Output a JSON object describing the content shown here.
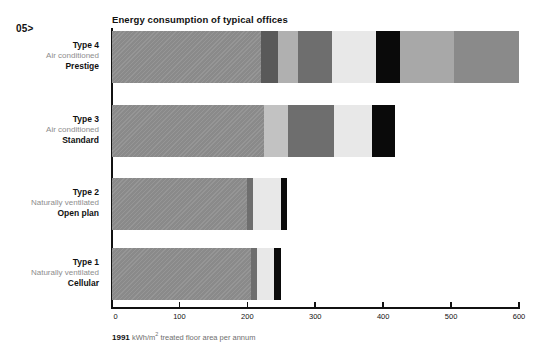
{
  "page_marker": "05>",
  "chart_title": "Energy consumption of typical offices",
  "caption": {
    "year": "1991",
    "unit_prefix": "kWh/m",
    "unit_sup": "2",
    "unit_suffix": " treated floor area per annum"
  },
  "axis": {
    "ticks": [
      0,
      100,
      200,
      300,
      400,
      500,
      600
    ],
    "tick_labels": [
      "0",
      "100",
      "200",
      "300",
      "400",
      "500",
      "600"
    ],
    "min": 0,
    "max": 600
  },
  "rows": [
    {
      "type": "Type 4",
      "middle": "Air conditioned",
      "bold": "Prestige"
    },
    {
      "type": "Type 3",
      "middle": "Air conditioned",
      "bold": "Standard"
    },
    {
      "type": "Type 2",
      "middle": "Naturally ventilated",
      "bold": "Open plan"
    },
    {
      "type": "Type 1",
      "middle": "Naturally ventilated",
      "bold": "Cellular"
    }
  ],
  "colors": {
    "base_gray": "#8a8a8a",
    "dark_gray": "#595959",
    "mid_gray": "#b0b0b0",
    "medium_gray": "#6e6e6e",
    "pale_gray": "#e8e8e8",
    "black": "#0a0a0a",
    "light_gray": "#a8a8a8",
    "edge_gray": "#6b6b6b",
    "axis": "#111111",
    "label_muted": "#8d8d8d"
  },
  "chart_data": {
    "type": "bar",
    "orientation": "horizontal",
    "stacked": true,
    "title": "Energy consumption of typical offices",
    "xlabel": "1991 kWh/m2 treated floor area per annum",
    "ylabel": "",
    "xlim": [
      0,
      600
    ],
    "grid": false,
    "legend": "none",
    "categories": [
      "Type 4 Air conditioned Prestige",
      "Type 3 Air conditioned Standard",
      "Type 2 Naturally ventilated Open plan",
      "Type 1 Naturally ventilated Cellular"
    ],
    "totals": [
      600,
      418,
      258,
      249
    ],
    "stacks": [
      {
        "category": "Type 4 Air conditioned Prestige",
        "total": 600,
        "segments": [
          {
            "value": 220,
            "color": "#8a8a8a",
            "hatch": true
          },
          {
            "value": 25,
            "color": "#595959",
            "hatch": false
          },
          {
            "value": 30,
            "color": "#b0b0b0",
            "hatch": false
          },
          {
            "value": 50,
            "color": "#6e6e6e",
            "hatch": false
          },
          {
            "value": 65,
            "color": "#e8e8e8",
            "hatch": false
          },
          {
            "value": 35,
            "color": "#0a0a0a",
            "hatch": false
          },
          {
            "value": 80,
            "color": "#a8a8a8",
            "hatch": false
          },
          {
            "value": 95,
            "color": "#8a8a8a",
            "hatch": false
          }
        ]
      },
      {
        "category": "Type 3 Air conditioned Standard",
        "total": 418,
        "segments": [
          {
            "value": 225,
            "color": "#8a8a8a",
            "hatch": true
          },
          {
            "value": 35,
            "color": "#c2c2c2",
            "hatch": false
          },
          {
            "value": 68,
            "color": "#6e6e6e",
            "hatch": false
          },
          {
            "value": 56,
            "color": "#e8e8e8",
            "hatch": false
          },
          {
            "value": 34,
            "color": "#0a0a0a",
            "hatch": false
          }
        ]
      },
      {
        "category": "Type 2 Naturally ventilated Open plan",
        "total": 258,
        "segments": [
          {
            "value": 200,
            "color": "#8a8a8a",
            "hatch": true
          },
          {
            "value": 8,
            "color": "#6e6e6e",
            "hatch": false
          },
          {
            "value": 41,
            "color": "#e8e8e8",
            "hatch": false
          },
          {
            "value": 9,
            "color": "#0a0a0a",
            "hatch": false
          }
        ]
      },
      {
        "category": "Type 1 Naturally ventilated Cellular",
        "total": 249,
        "segments": [
          {
            "value": 206,
            "color": "#8a8a8a",
            "hatch": true
          },
          {
            "value": 8,
            "color": "#6e6e6e",
            "hatch": false
          },
          {
            "value": 26,
            "color": "#e8e8e8",
            "hatch": false
          },
          {
            "value": 9,
            "color": "#0a0a0a",
            "hatch": false
          }
        ]
      }
    ]
  }
}
